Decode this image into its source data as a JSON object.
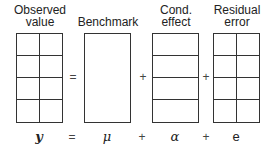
{
  "diagram": {
    "columns": [
      {
        "id": "observed",
        "title_line1": "Observed",
        "title_line2": "value",
        "symbol": "y",
        "grid": {
          "cols": 2,
          "rows": 4
        }
      },
      {
        "id": "benchmark",
        "title_line1": "",
        "title_line2": "Benchmark",
        "symbol": "μ",
        "grid": {
          "cols": 1,
          "rows": 1
        }
      },
      {
        "id": "cond_effect",
        "title_line1": "Cond.",
        "title_line2": "effect",
        "symbol": "α",
        "grid": {
          "cols": 1,
          "rows": 4
        }
      },
      {
        "id": "residual_error",
        "title_line1": "Residual",
        "title_line2": "error",
        "symbol": "e",
        "grid": {
          "cols": 2,
          "rows": 4
        }
      }
    ],
    "operators": {
      "box_eq": "=",
      "box_plus1": "+",
      "box_plus2": "+",
      "eq_eq": "=",
      "eq_plus1": "+",
      "eq_plus2": "+"
    },
    "equation": "y = μ + α + e"
  }
}
